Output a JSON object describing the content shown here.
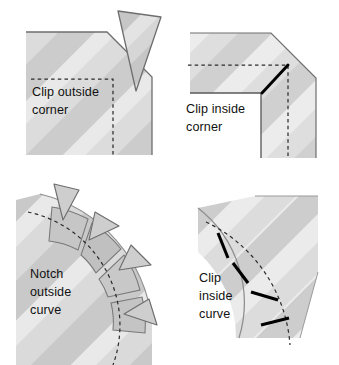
{
  "figure": {
    "type": "instructional-diagram",
    "background_color": "#ffffff",
    "panel_count": 4
  },
  "colors": {
    "fabric_light": "#e7e7e7",
    "fabric_mid": "#d2d2d2",
    "fabric_dark": "#bdbdbd",
    "fabric_darker": "#aeaeae",
    "outline": "#6b6b6b",
    "dashed_line": "#2b2b2b",
    "clip_mark": "#000000",
    "text": "#111111",
    "cut_piece_fill": "#cfcfcf"
  },
  "panels": [
    {
      "id": "clip-outside-corner",
      "label_line1": "Clip outside",
      "label_line2": "corner",
      "label_text": "Clip outside corner",
      "technique": "clip",
      "shape": "outside-corner",
      "has_cut_away_piece": true,
      "cut_piece_name": "trimmed-corner-triangle",
      "stitch_line_style": "dashed",
      "clip_mark_count": 0
    },
    {
      "id": "clip-inside-corner",
      "label_line1": "Clip inside",
      "label_line2": "corner",
      "label_text": "Clip inside corner",
      "technique": "clip",
      "shape": "inside-corner",
      "has_cut_away_piece": false,
      "stitch_line_style": "dashed",
      "clip_mark_count": 1
    },
    {
      "id": "notch-outside-curve",
      "label_line1": "Notch",
      "label_line2": "outside",
      "label_line3": "curve",
      "label_text": "Notch outside curve",
      "technique": "notch",
      "shape": "outside-curve",
      "has_cut_away_piece": true,
      "notch_wedge_count": 4,
      "stitch_line_style": "dashed",
      "clip_mark_count": 0
    },
    {
      "id": "clip-inside-curve",
      "label_line1": "Clip",
      "label_line2": "inside",
      "label_line3": "curve",
      "label_text": "Clip inside curve",
      "technique": "clip",
      "shape": "inside-curve",
      "has_cut_away_piece": false,
      "stitch_line_style": "dashed",
      "clip_mark_count": 4
    }
  ],
  "labels": {
    "p1_l1": "Clip outside",
    "p1_l2": "corner",
    "p2_l1": "Clip inside",
    "p2_l2": "corner",
    "p3_l1": "Notch",
    "p3_l2": "outside",
    "p3_l3": "curve",
    "p4_l1": "Clip",
    "p4_l2": "inside",
    "p4_l3": "curve"
  }
}
